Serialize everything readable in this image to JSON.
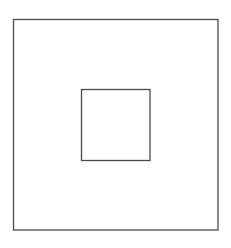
{
  "canvas": {
    "width": 231,
    "height": 248,
    "background": "#ffffff"
  },
  "shapes": [
    {
      "name": "outer-square",
      "type": "rect",
      "x": 13.5,
      "y": 19.5,
      "width": 204.5,
      "height": 210.5,
      "stroke": "#4a4a4a",
      "stroke_width": 1.3,
      "fill": "none"
    },
    {
      "name": "inner-square",
      "type": "rect",
      "x": 81.5,
      "y": 89.5,
      "width": 68.5,
      "height": 71,
      "stroke": "#4a4a4a",
      "stroke_width": 1.3,
      "fill": "none"
    }
  ]
}
